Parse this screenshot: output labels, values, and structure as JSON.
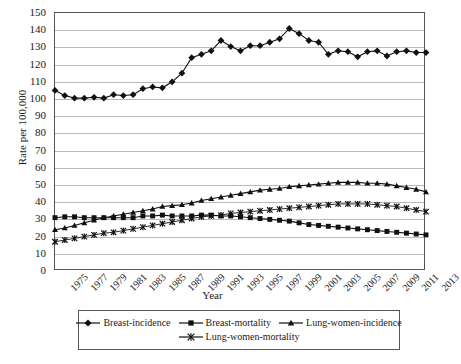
{
  "chart_data": {
    "type": "line",
    "title": "",
    "xlabel": "Year",
    "ylabel": "Rate per 100,000",
    "xlim": [
      1975,
      2013
    ],
    "ylim": [
      0,
      150
    ],
    "ytick_step": 10,
    "xtick_step": 2,
    "grid": true,
    "legend_position": "bottom",
    "yticks": [
      0,
      10,
      20,
      30,
      40,
      50,
      60,
      70,
      80,
      90,
      100,
      110,
      120,
      130,
      140,
      150
    ],
    "x": [
      1975,
      1976,
      1977,
      1978,
      1979,
      1980,
      1981,
      1982,
      1983,
      1984,
      1985,
      1986,
      1987,
      1988,
      1989,
      1990,
      1991,
      1992,
      1993,
      1994,
      1995,
      1996,
      1997,
      1998,
      1999,
      2000,
      2001,
      2002,
      2003,
      2004,
      2005,
      2006,
      2007,
      2008,
      2009,
      2010,
      2011,
      2012,
      2013
    ],
    "xticklabels": [
      "1975",
      "1977",
      "1979",
      "1981",
      "1983",
      "1985",
      "1987",
      "1989",
      "1991",
      "1993",
      "1995",
      "1997",
      "1999",
      "2001",
      "2003",
      "2005",
      "2007",
      "2009",
      "2011",
      "2013"
    ],
    "series": [
      {
        "name": "Breast-incidence",
        "marker": "diamond",
        "color": "#111111",
        "values": [
          105,
          102,
          100.5,
          100.5,
          101,
          100.5,
          102.5,
          102,
          102.5,
          106,
          107,
          106.5,
          110,
          115,
          124,
          126,
          128,
          134,
          130.5,
          128,
          131,
          131,
          133,
          135,
          141,
          138,
          134,
          133,
          126,
          128,
          127.5,
          124.5,
          127.5,
          128,
          125,
          127.5,
          128,
          127,
          127
        ]
      },
      {
        "name": "Breast-mortality",
        "marker": "square",
        "color": "#111111",
        "values": [
          31,
          31.5,
          31.5,
          31,
          31,
          31,
          31,
          31,
          31,
          32,
          32,
          32.5,
          32,
          32,
          32,
          32.5,
          32.5,
          32,
          32,
          31.5,
          31,
          30.5,
          30,
          29.5,
          29,
          28,
          27,
          26.5,
          26,
          25.5,
          25,
          24.5,
          24,
          23.5,
          23,
          22.5,
          22,
          21.5,
          21
        ]
      },
      {
        "name": "Lung-women-incidence",
        "marker": "triangle",
        "color": "#111111",
        "values": [
          24,
          25,
          26.5,
          28,
          29.5,
          31,
          32,
          33,
          34,
          35,
          36,
          37.5,
          38,
          38.5,
          39.5,
          41,
          42,
          43,
          44,
          45,
          46,
          47,
          47.5,
          48,
          49,
          49.5,
          50,
          50.5,
          51,
          51.5,
          51.5,
          51.5,
          51,
          51,
          50.5,
          49.5,
          48.5,
          47.5,
          46
        ]
      },
      {
        "name": "Lung-women-mortality",
        "marker": "cross",
        "color": "#111111",
        "values": [
          17,
          18,
          19,
          20,
          21,
          22,
          22.5,
          23.5,
          24.5,
          25.5,
          26.5,
          27.5,
          28.5,
          29.5,
          30.5,
          31.5,
          32,
          32.5,
          33.5,
          34,
          34.5,
          35,
          35.5,
          36,
          36.5,
          37,
          37.5,
          38,
          38.5,
          39,
          39,
          39,
          39,
          38.5,
          38,
          37.5,
          36.5,
          35.5,
          34.5
        ]
      }
    ]
  },
  "legend": {
    "rows": [
      [
        "Breast-incidence",
        "Breast-mortality",
        "Lung-women-incidence"
      ],
      [
        "Lung-women-mortality"
      ]
    ]
  }
}
